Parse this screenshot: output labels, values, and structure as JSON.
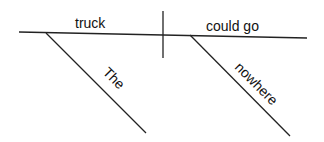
{
  "diagram": {
    "type": "sentence-diagram",
    "sentence_parts": {
      "subject": "truck",
      "predicate": "could go",
      "subject_modifier": "The",
      "predicate_modifier": "nowhere"
    },
    "colors": {
      "line": "#222222",
      "text": "#111111",
      "background": "#ffffff"
    }
  }
}
